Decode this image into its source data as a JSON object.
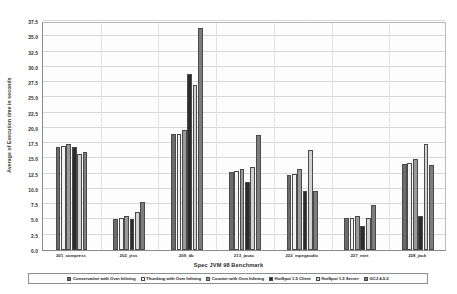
{
  "chart_data": {
    "type": "bar",
    "title": "",
    "xlabel": "Spec JVM 98 Benchmark",
    "ylabel": "Average of Execution time in seconds",
    "ylim": [
      0,
      37.5
    ],
    "ytick_step": 2.5,
    "grid": true,
    "legend_position": "bottom",
    "yticks": [
      "0.0",
      "2.5",
      "5.0",
      "7.5",
      "10.0",
      "12.5",
      "15.0",
      "17.5",
      "20.0",
      "22.5",
      "25.0",
      "27.5",
      "30.0",
      "32.5",
      "35.0",
      "37.5"
    ],
    "categories": [
      "201_compress",
      "202_jess",
      "209_db",
      "213_javac",
      "222_mpegaudio",
      "227_mtrt",
      "228_jack"
    ],
    "series": [
      {
        "name": "Conservative with Ovm Inlining",
        "color": "#6b6b6b",
        "values": [
          16.8,
          5.1,
          19.0,
          12.7,
          12.3,
          5.2,
          14.1
        ]
      },
      {
        "name": "Thunking with Ovm Inlining",
        "color": "#f2f2f2",
        "values": [
          17.1,
          5.3,
          19.0,
          13.0,
          12.5,
          5.2,
          14.3
        ]
      },
      {
        "name": "Counter with Ovm Inlining",
        "color": "#9a9a9a",
        "values": [
          17.3,
          5.6,
          19.7,
          13.2,
          13.3,
          5.5,
          14.9
        ]
      },
      {
        "name": "HotSpot 1.5 Client",
        "color": "#2b2b2b",
        "values": [
          16.9,
          5.0,
          28.8,
          11.2,
          9.6,
          4.0,
          5.5
        ]
      },
      {
        "name": "HotSpot 1.5 Server",
        "color": "#d2d2d2",
        "values": [
          15.7,
          6.2,
          27.0,
          13.6,
          16.3,
          5.3,
          17.3
        ]
      },
      {
        "name": "GCJ 4.0.2",
        "color": "#7d7d7d",
        "values": [
          16.0,
          7.8,
          36.3,
          18.9,
          9.6,
          7.3,
          14.0
        ]
      }
    ]
  }
}
